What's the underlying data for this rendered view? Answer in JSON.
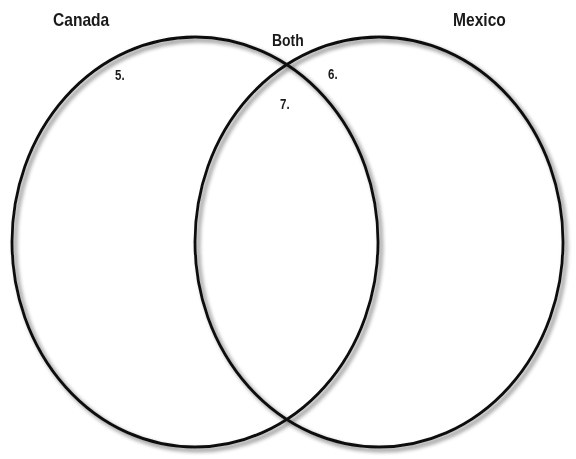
{
  "diagram": {
    "type": "venn",
    "stroke_color": "#111111",
    "shadow_color": "#9a9a9a",
    "sets": [
      {
        "id": "left",
        "label": "Canada",
        "region_number": "5."
      },
      {
        "id": "right",
        "label": "Mexico",
        "region_number": "6."
      }
    ],
    "overlap": {
      "label": "Both",
      "region_number": "7."
    }
  }
}
